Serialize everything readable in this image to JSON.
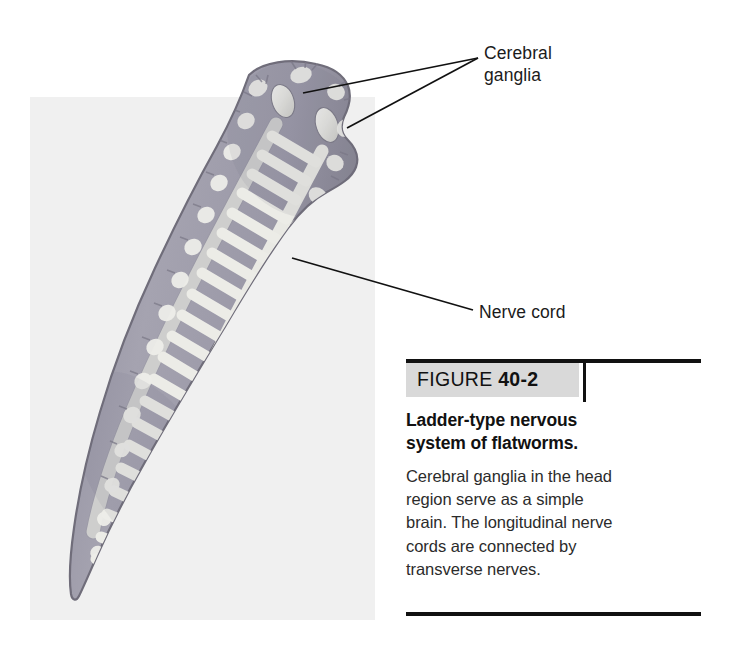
{
  "figure": {
    "background_panel_color": "#f0f0f0",
    "organism": "flatworm (planarian) ladder-type nervous system",
    "labels": [
      {
        "id": "cerebral-ganglia",
        "text": "Cerebral\nganglia",
        "points_to": [
          "left cerebral ganglion",
          "right cerebral ganglion"
        ]
      },
      {
        "id": "nerve-cord",
        "text": "Nerve cord",
        "points_to": [
          "longitudinal nerve cord"
        ]
      }
    ],
    "anatomy": {
      "body_fill": "#9a98a6",
      "nerve_fill": "#e8e8e4",
      "outline": "#6d6b78"
    }
  },
  "caption": {
    "figure_word": "FIGURE ",
    "figure_number": "40-2",
    "title": "Ladder-type nervous\nsystem of flatworms.",
    "body": "Cerebral ganglia in the head\nregion serve as a simple\nbrain. The longitudinal nerve\ncords are connected by\ntransverse nerves.",
    "rule_color": "#111111",
    "band_color": "#d9d9d9"
  }
}
